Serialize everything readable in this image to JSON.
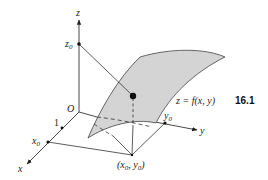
{
  "figure": {
    "number": "16.1",
    "equation": "z = f(x, y)",
    "colors": {
      "surface_fill": "#d4d4d4",
      "stroke": "#333333",
      "background": "#ffffff"
    }
  },
  "axes": {
    "x": {
      "label": "x",
      "tick_label": "1",
      "point_label": "x",
      "point_sub": "0"
    },
    "y": {
      "label": "y",
      "point_label": "y",
      "point_sub": "0"
    },
    "z": {
      "label": "z",
      "point_label": "z",
      "point_sub": "0"
    },
    "origin": {
      "label": "O"
    }
  },
  "base_point": {
    "open": "(",
    "x": "x",
    "x_sub": "0",
    "sep": ", ",
    "y": "y",
    "y_sub": "0",
    "close": ")"
  }
}
